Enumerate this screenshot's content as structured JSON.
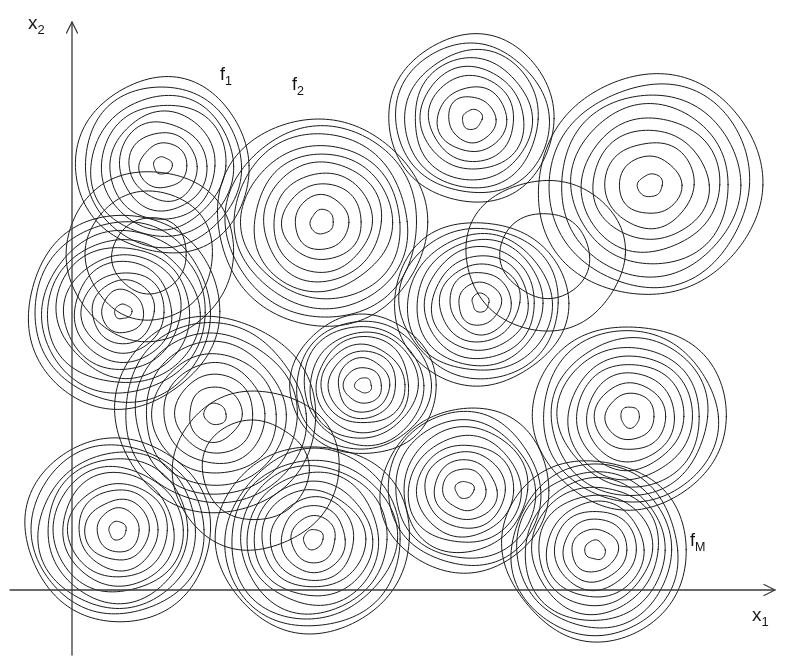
{
  "figure": {
    "background_color": "#ffffff",
    "stroke_color": "#1a1a1a",
    "stroke_width": 1.0,
    "width": 800,
    "height": 670
  },
  "axes": {
    "x_axis": {
      "name": "x1",
      "label_main": "x",
      "label_sub": "1",
      "label_x": 752,
      "label_y": 604,
      "y": 590,
      "x_start": 10,
      "x_end": 775,
      "arrow": "right"
    },
    "y_axis": {
      "name": "x2",
      "label_main": "x",
      "label_sub": "2",
      "label_x": 28,
      "label_y": 12,
      "x": 72,
      "y_start": 655,
      "y_end": 22,
      "arrow": "up"
    }
  },
  "annotations": [
    {
      "id": "f1",
      "label_main": "f",
      "label_sub": "1",
      "x": 220,
      "y": 64
    },
    {
      "id": "f2",
      "label_main": "f",
      "label_sub": "2",
      "x": 292,
      "y": 74
    },
    {
      "id": "fM",
      "label_main": "f",
      "label_sub": "M",
      "x": 690,
      "y": 530
    }
  ],
  "chart_data": {
    "type": "contour",
    "xlabel": "x1",
    "ylabel": "x2",
    "grid": false,
    "legend": false,
    "n_optima": 16,
    "contour_clusters": [
      {
        "id": "f1",
        "label": "f1",
        "cx": 163,
        "cy": 166,
        "r_outer": 88,
        "r_inner": 9,
        "n_rings": 9
      },
      {
        "id": "f2",
        "label": "f2",
        "cx": 322,
        "cy": 222,
        "r_outer": 105,
        "r_inner": 12,
        "n_rings": 10
      },
      {
        "id": "c3",
        "label": "",
        "cx": 472,
        "cy": 119,
        "r_outer": 84,
        "r_inner": 10,
        "n_rings": 9
      },
      {
        "id": "c4",
        "label": "",
        "cx": 650,
        "cy": 185,
        "r_outer": 112,
        "r_inner": 12,
        "n_rings": 9
      },
      {
        "id": "c5",
        "label": "",
        "cx": 123,
        "cy": 312,
        "r_outer": 97,
        "r_inner": 8,
        "n_rings": 11
      },
      {
        "id": "c6",
        "label": "",
        "cx": 480,
        "cy": 303,
        "r_outer": 85,
        "r_inner": 9,
        "n_rings": 10
      },
      {
        "id": "c7",
        "label": "",
        "cx": 363,
        "cy": 385,
        "r_outer": 72,
        "r_inner": 8,
        "n_rings": 10
      },
      {
        "id": "c8",
        "label": "",
        "cx": 215,
        "cy": 414,
        "r_outer": 100,
        "r_inner": 11,
        "n_rings": 9
      },
      {
        "id": "c9",
        "label": "",
        "cx": 630,
        "cy": 417,
        "r_outer": 95,
        "r_inner": 10,
        "n_rings": 10
      },
      {
        "id": "c10",
        "label": "",
        "cx": 465,
        "cy": 490,
        "r_outer": 84,
        "r_inner": 9,
        "n_rings": 10
      },
      {
        "id": "c11",
        "label": "",
        "cx": 313,
        "cy": 539,
        "r_outer": 96,
        "r_inner": 10,
        "n_rings": 11
      },
      {
        "id": "c12",
        "label": "",
        "cx": 118,
        "cy": 530,
        "r_outer": 93,
        "r_inner": 9,
        "n_rings": 11
      },
      {
        "id": "fM",
        "label": "fM",
        "cx": 595,
        "cy": 550,
        "r_outer": 92,
        "r_inner": 10,
        "n_rings": 11
      },
      {
        "id": "c14",
        "label": "",
        "cx": 150,
        "cy": 255,
        "r_outer": 85,
        "r_inner": 38,
        "n_rings": 3
      },
      {
        "id": "c15",
        "label": "",
        "cx": 545,
        "cy": 255,
        "r_outer": 78,
        "r_inner": 44,
        "n_rings": 2
      },
      {
        "id": "c16",
        "label": "",
        "cx": 255,
        "cy": 470,
        "r_outer": 82,
        "r_inner": 52,
        "n_rings": 2
      }
    ]
  }
}
